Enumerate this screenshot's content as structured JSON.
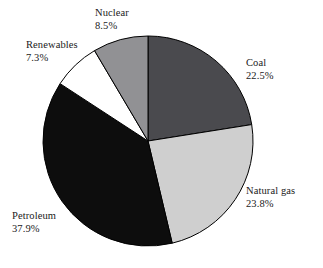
{
  "chart_data": {
    "type": "pie",
    "title": "",
    "subtitle": "",
    "xlabel": "",
    "ylabel": "",
    "legend_position": "none",
    "grid": false,
    "start_angle_deg": 0,
    "direction": "clockwise",
    "categories": [
      "Coal",
      "Natural gas",
      "Petroleum",
      "Renewables",
      "Nuclear"
    ],
    "values": [
      22.5,
      23.8,
      37.9,
      7.3,
      8.5
    ],
    "value_suffix": "%",
    "colors": [
      "#4a4a4e",
      "#cfcfcf",
      "#0d0d0d",
      "#ffffff",
      "#919194"
    ],
    "slices": [
      {
        "label": "Coal",
        "value": 22.5,
        "value_text": "22.5%",
        "color": "#4a4a4e",
        "start_deg": 0.0,
        "end_deg": 81.0,
        "label_x": 246,
        "label_y": 57
      },
      {
        "label": "Natural gas",
        "value": 23.8,
        "value_text": "23.8%",
        "color": "#cfcfcf",
        "start_deg": 81.0,
        "end_deg": 166.68,
        "label_x": 246,
        "label_y": 185
      },
      {
        "label": "Petroleum",
        "value": 37.9,
        "value_text": "37.9%",
        "color": "#0d0d0d",
        "start_deg": 166.68,
        "end_deg": 303.12,
        "label_x": 12,
        "label_y": 210
      },
      {
        "label": "Renewables",
        "value": 7.3,
        "value_text": "7.3%",
        "color": "#ffffff",
        "start_deg": 303.12,
        "end_deg": 329.4,
        "label_x": 26,
        "label_y": 39
      },
      {
        "label": "Nuclear",
        "value": 8.5,
        "value_text": "8.5%",
        "color": "#919194",
        "start_deg": 329.4,
        "end_deg": 360.0,
        "label_x": 95,
        "label_y": 7
      }
    ],
    "geometry": {
      "center_x": 148,
      "center_y": 141,
      "radius": 105
    },
    "background_color": "#ffffff",
    "outline_color": "#000000"
  }
}
